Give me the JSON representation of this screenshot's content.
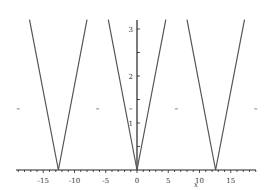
{
  "chart_data": {
    "type": "line",
    "title": "",
    "xlabel": "x",
    "ylabel": "",
    "xlim": [
      -19.5,
      19.5
    ],
    "ylim": [
      0,
      3.2
    ],
    "x_ticks": [
      -15,
      -10,
      -5,
      0,
      5,
      10,
      15
    ],
    "x_tick_labels": [
      "-15",
      "-10",
      "-5",
      "0",
      "5",
      "10",
      "15"
    ],
    "y_ticks": [
      1,
      2,
      3
    ],
    "y_tick_labels": [
      "1",
      "2",
      "3"
    ],
    "grid": false,
    "legend": null,
    "series": [
      {
        "name": "curve-left",
        "x": [
          -17.2,
          -12.57,
          -8.0
        ],
        "y": [
          3.2,
          0,
          3.2
        ]
      },
      {
        "name": "curve-center",
        "x": [
          -4.6,
          0,
          4.6
        ],
        "y": [
          3.2,
          0,
          3.2
        ]
      },
      {
        "name": "curve-right",
        "x": [
          8.0,
          12.57,
          17.2
        ],
        "y": [
          3.2,
          0,
          3.2
        ]
      }
    ],
    "markers": {
      "x": [
        -19.0,
        -6.3,
        6.3,
        19.0,
        -1.0
      ],
      "y": [
        1.3,
        1.3,
        1.3,
        1.3,
        1.3
      ]
    },
    "line_color": "#555555",
    "axis_color": "#222222"
  }
}
